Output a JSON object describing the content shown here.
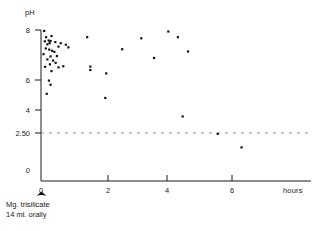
{
  "chart_data": {
    "type": "scatter",
    "title": "",
    "xlabel": "hours",
    "ylabel": "pH",
    "xlim": [
      -0.35,
      7.2
    ],
    "ylim": [
      0,
      8.6
    ],
    "grid": false,
    "legend": null,
    "xticks": [
      0,
      2,
      4,
      6
    ],
    "xtick_labels": [
      "0",
      "2",
      "4",
      "6"
    ],
    "yticks": [
      0,
      2.5,
      4,
      6,
      8
    ],
    "ytick_labels": [
      "0",
      "2.50",
      "4",
      "6",
      "8"
    ],
    "threshold_line": {
      "value": 2.5,
      "label": "2.50",
      "style": "dashed",
      "orientation": "horizontal"
    },
    "annotations": [
      {
        "text": "Mg. trisilicate",
        "x": 0,
        "y": -1.2
      },
      {
        "text": "14 ml. orally",
        "x": 0,
        "y": -1.6
      }
    ],
    "dose_marker": {
      "x": 0,
      "shape": "filled-arrow"
    },
    "series": [
      {
        "name": "gastric pH",
        "marker": "square",
        "color": "#111111",
        "points": [
          [
            0.1,
            7.95
          ],
          [
            0.16,
            7.62
          ],
          [
            0.33,
            7.68
          ],
          [
            0.12,
            7.4
          ],
          [
            0.24,
            7.44
          ],
          [
            0.3,
            7.42
          ],
          [
            0.27,
            7.3
          ],
          [
            0.2,
            7.24
          ],
          [
            0.45,
            7.36
          ],
          [
            0.62,
            7.3
          ],
          [
            0.55,
            7.12
          ],
          [
            0.78,
            7.22
          ],
          [
            0.86,
            7.08
          ],
          [
            0.15,
            7.02
          ],
          [
            0.26,
            6.96
          ],
          [
            0.35,
            6.9
          ],
          [
            0.42,
            6.84
          ],
          [
            0.08,
            6.72
          ],
          [
            0.3,
            6.6
          ],
          [
            0.5,
            6.62
          ],
          [
            0.2,
            6.44
          ],
          [
            0.38,
            6.38
          ],
          [
            0.46,
            6.26
          ],
          [
            0.28,
            6.18
          ],
          [
            0.13,
            6.05
          ],
          [
            0.55,
            6.02
          ],
          [
            0.7,
            6.08
          ],
          [
            0.33,
            5.82
          ],
          [
            0.25,
            5.32
          ],
          [
            0.3,
            5.1
          ],
          [
            0.18,
            4.62
          ],
          [
            1.55,
            6.06
          ],
          [
            1.55,
            5.88
          ],
          [
            1.45,
            7.62
          ],
          [
            2.05,
            5.7
          ],
          [
            2.02,
            4.4
          ],
          [
            2.55,
            6.98
          ],
          [
            3.15,
            7.56
          ],
          [
            3.55,
            6.52
          ],
          [
            4.0,
            7.92
          ],
          [
            4.3,
            7.62
          ],
          [
            4.45,
            3.42
          ],
          [
            4.62,
            6.86
          ],
          [
            5.55,
            2.5
          ],
          [
            6.3,
            1.78
          ]
        ]
      }
    ]
  },
  "figure": {
    "axis_color": "#1a1a1a",
    "marker_color": "#111111",
    "dash_color": "#8a8a8a",
    "background": "#ffffff"
  }
}
